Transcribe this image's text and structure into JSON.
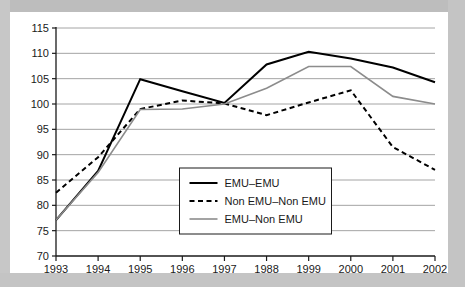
{
  "chart_data": {
    "type": "line",
    "title": "",
    "subtitle": "",
    "xlabel": "",
    "ylabel": "",
    "categories": [
      "1993",
      "1994",
      "1995",
      "1996",
      "1997",
      "1988",
      "1999",
      "2000",
      "2001",
      "2002"
    ],
    "xlim": [
      0,
      9
    ],
    "ylim": [
      70,
      115
    ],
    "ytick_values": [
      70,
      75,
      80,
      85,
      90,
      95,
      100,
      105,
      110,
      115
    ],
    "ytick_labels": [
      "70",
      "75",
      "80",
      "85",
      "90",
      "95",
      "100",
      "105",
      "110",
      "115"
    ],
    "grid": true,
    "grid_axis": "y",
    "legend_position": "inside-bottom-center",
    "series": [
      {
        "name": "EMU–EMU",
        "style": "solid",
        "color": "#000000",
        "width": 2.0,
        "values": [
          77.1,
          86.8,
          104.9,
          102.5,
          100.2,
          107.8,
          110.3,
          109.0,
          107.2,
          104.3
        ]
      },
      {
        "name": "Non EMU–Non EMU",
        "style": "dashed",
        "color": "#000000",
        "width": 2.0,
        "values": [
          82.5,
          89.5,
          99.0,
          100.7,
          100.1,
          97.8,
          100.3,
          102.7,
          91.5,
          87.0
        ]
      },
      {
        "name": "EMU–Non EMU",
        "style": "solid",
        "color": "#8c8c8c",
        "width": 1.6,
        "values": [
          77.1,
          86.5,
          98.9,
          99.0,
          100.0,
          103.1,
          107.4,
          107.4,
          101.5,
          100.0
        ]
      }
    ]
  },
  "legend": {
    "items": [
      {
        "label": "EMU–EMU"
      },
      {
        "label": "Non EMU–Non EMU"
      },
      {
        "label": "EMU–Non EMU"
      }
    ]
  },
  "colors": {
    "plot_background": "#ffffff",
    "frame": "#c6c6c6",
    "axis": "#1a1a1a",
    "gridline": "#9a9a9a",
    "series_primary": "#000000",
    "series_secondary": "#000000",
    "series_tertiary": "#8c8c8c"
  }
}
